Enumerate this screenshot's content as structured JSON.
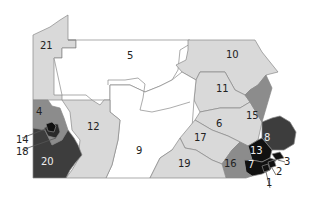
{
  "map": {
    "title": "",
    "colors": {
      "white": "#ffffff",
      "light": "#d9d9d9",
      "medium": "#8c8c8c",
      "dark": "#3d3d3d",
      "black": "#111111",
      "border": "#888888"
    },
    "regions": [
      {
        "id": "1",
        "label": "1",
        "shade": "black"
      },
      {
        "id": "2",
        "label": "2",
        "shade": "black"
      },
      {
        "id": "3",
        "label": "3",
        "shade": "black"
      },
      {
        "id": "4",
        "label": "4",
        "shade": "medium"
      },
      {
        "id": "5",
        "label": "5",
        "shade": "white"
      },
      {
        "id": "6",
        "label": "6",
        "shade": "light"
      },
      {
        "id": "7",
        "label": "7",
        "shade": "black"
      },
      {
        "id": "8",
        "label": "8",
        "shade": "dark"
      },
      {
        "id": "9",
        "label": "9",
        "shade": "white"
      },
      {
        "id": "10",
        "label": "10",
        "shade": "light"
      },
      {
        "id": "11",
        "label": "11",
        "shade": "light"
      },
      {
        "id": "12",
        "label": "12",
        "shade": "light"
      },
      {
        "id": "13",
        "label": "13",
        "shade": "black"
      },
      {
        "id": "14",
        "label": "14",
        "shade": "black"
      },
      {
        "id": "15",
        "label": "15",
        "shade": "medium"
      },
      {
        "id": "16",
        "label": "16",
        "shade": "medium"
      },
      {
        "id": "17",
        "label": "17",
        "shade": "light"
      },
      {
        "id": "18",
        "label": "18",
        "shade": "dark"
      },
      {
        "id": "19",
        "label": "19",
        "shade": "light"
      },
      {
        "id": "20",
        "label": "20",
        "shade": "dark"
      },
      {
        "id": "21",
        "label": "21",
        "shade": "light"
      }
    ]
  }
}
